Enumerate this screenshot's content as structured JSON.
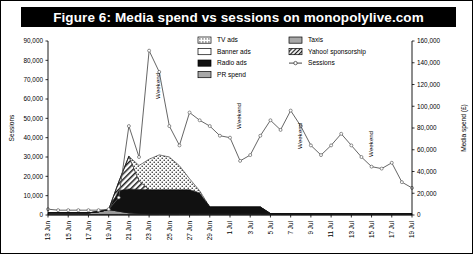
{
  "figure": {
    "title": "Figure 6: Media spend vs sessions on monopolylive.com",
    "title_bg": "#000000",
    "title_fg": "#ffffff"
  },
  "axes": {
    "left": {
      "title": "Sessions",
      "ticks": [
        "0",
        "10,000",
        "20,000",
        "30,000",
        "40,000",
        "50,000",
        "60,000",
        "70,000",
        "80,000",
        "90,000"
      ],
      "min": 0,
      "max": 90000,
      "step": 10000
    },
    "right": {
      "title": "Media spend (£)",
      "ticks": [
        "0",
        "20,000",
        "40,000",
        "60,000",
        "80,000",
        "100,000",
        "120,000",
        "140,000",
        "160,000"
      ],
      "min": 0,
      "max": 160000,
      "step": 20000
    },
    "bottom": {
      "ticks": [
        "13 Jun",
        "15 Jun",
        "17 Jun",
        "19 Jun",
        "21 Jun",
        "23 Jun",
        "25 Jun",
        "27 Jun",
        "29 Jun",
        "1 Jul",
        "3 Jul",
        "5 Jul",
        "7 Jul",
        "9 Jul",
        "11 Jul",
        "13 Jul",
        "15 Jul",
        "17 Jul",
        "19 Jul"
      ]
    }
  },
  "legend": {
    "position": "top-right-inside",
    "entries": [
      {
        "label": "TV ads",
        "style": "dotted",
        "color": "#ffffff"
      },
      {
        "label": "Banner ads",
        "style": "solid-white",
        "color": "#ffffff"
      },
      {
        "label": "Radio ads",
        "style": "solid-black",
        "color": "#000000"
      },
      {
        "label": "PR spend",
        "style": "solid-gray",
        "color": "#9a9a9a"
      },
      {
        "label": "Taxis",
        "style": "solid-gray",
        "color": "#b3b3b3"
      },
      {
        "label": "Yahoo! sponsorship",
        "style": "hatched",
        "color": "#ffffff"
      },
      {
        "label": "Sessions",
        "style": "line-marker",
        "color": "#555555"
      }
    ]
  },
  "annotations": [
    {
      "text": "Weekend",
      "at_x": "24 Jun",
      "rotation": -90
    },
    {
      "text": "Weekend",
      "at_x": "2 Jul",
      "rotation": -90
    },
    {
      "text": "Weekend",
      "at_x": "8 Jul",
      "rotation": -90
    },
    {
      "text": "Weekend",
      "at_x": "15 Jul",
      "rotation": -90
    }
  ],
  "chart_data": {
    "type": "area",
    "title": "Figure 6: Media spend vs sessions on monopolylive.com",
    "xlabel": "",
    "ylabel": "Sessions",
    "y2label": "Media spend (£)",
    "ylim": [
      0,
      90000
    ],
    "y2lim": [
      0,
      160000
    ],
    "grid": false,
    "legend": "top-right",
    "x": [
      "13 Jun",
      "14 Jun",
      "15 Jun",
      "16 Jun",
      "17 Jun",
      "18 Jun",
      "19 Jun",
      "20 Jun",
      "21 Jun",
      "22 Jun",
      "23 Jun",
      "24 Jun",
      "25 Jun",
      "26 Jun",
      "27 Jun",
      "28 Jun",
      "29 Jun",
      "30 Jun",
      "1 Jul",
      "2 Jul",
      "3 Jul",
      "4 Jul",
      "5 Jul",
      "6 Jul",
      "7 Jul",
      "8 Jul",
      "9 Jul",
      "10 Jul",
      "11 Jul",
      "12 Jul",
      "13 Jul",
      "14 Jul",
      "15 Jul",
      "16 Jul",
      "17 Jul",
      "18 Jul",
      "19 Jul"
    ],
    "series": [
      {
        "name": "Sessions",
        "axis": "left",
        "type": "line",
        "values": [
          3000,
          2500,
          2500,
          2500,
          2500,
          2500,
          3000,
          9000,
          46000,
          30000,
          85000,
          74000,
          46000,
          36000,
          53000,
          49000,
          46000,
          41000,
          40000,
          28000,
          31000,
          41000,
          49000,
          44000,
          54000,
          46000,
          36000,
          31000,
          36000,
          42000,
          36000,
          30000,
          25000,
          24000,
          27000,
          17000,
          14000
        ]
      },
      {
        "name": "Radio ads",
        "axis": "right",
        "type": "area-stacked",
        "values": [
          0,
          0,
          0,
          0,
          0,
          0,
          0,
          19000,
          22000,
          22000,
          22000,
          22000,
          22000,
          22000,
          22000,
          19000,
          6000,
          6000,
          6000,
          6000,
          6000,
          6000,
          0,
          0,
          0,
          0,
          0,
          0,
          0,
          0,
          0,
          0,
          0,
          0,
          0,
          0,
          0
        ]
      },
      {
        "name": "Yahoo! sponsorship",
        "axis": "right",
        "type": "area-stacked",
        "values": [
          0,
          0,
          0,
          0,
          0,
          0,
          0,
          8000,
          30000,
          8000,
          0,
          0,
          0,
          0,
          0,
          0,
          0,
          0,
          0,
          0,
          0,
          0,
          0,
          0,
          0,
          0,
          0,
          0,
          0,
          0,
          0,
          0,
          0,
          0,
          0,
          0,
          0
        ]
      },
      {
        "name": "TV ads",
        "axis": "right",
        "type": "area-stacked",
        "values": [
          0,
          0,
          0,
          0,
          0,
          0,
          0,
          0,
          0,
          14000,
          28000,
          32000,
          30000,
          22000,
          10000,
          2000,
          0,
          0,
          0,
          0,
          0,
          0,
          0,
          0,
          0,
          0,
          0,
          0,
          0,
          0,
          0,
          0,
          0,
          0,
          0,
          0,
          0
        ]
      },
      {
        "name": "PR spend",
        "axis": "right",
        "type": "area-stacked",
        "values": [
          1500,
          1500,
          1500,
          1500,
          1500,
          2500,
          4500,
          3000,
          1500,
          1000,
          800,
          800,
          800,
          800,
          800,
          800,
          800,
          800,
          800,
          800,
          800,
          800,
          800,
          800,
          800,
          800,
          800,
          800,
          800,
          800,
          800,
          800,
          800,
          800,
          800,
          800,
          800
        ]
      },
      {
        "name": "Taxis",
        "axis": "right",
        "type": "area-stacked",
        "values": [
          500,
          500,
          500,
          500,
          500,
          500,
          500,
          500,
          500,
          500,
          500,
          500,
          500,
          500,
          500,
          500,
          500,
          500,
          500,
          500,
          500,
          500,
          500,
          500,
          500,
          500,
          500,
          500,
          500,
          500,
          500,
          500,
          500,
          500,
          500,
          500,
          500
        ]
      },
      {
        "name": "Banner ads",
        "axis": "right",
        "type": "area-stacked",
        "values": [
          0,
          0,
          0,
          0,
          0,
          0,
          0,
          0,
          0,
          0,
          0,
          0,
          0,
          0,
          0,
          0,
          0,
          0,
          0,
          0,
          0,
          0,
          0,
          0,
          0,
          0,
          0,
          0,
          0,
          0,
          0,
          0,
          0,
          0,
          0,
          0,
          0
        ]
      }
    ]
  }
}
